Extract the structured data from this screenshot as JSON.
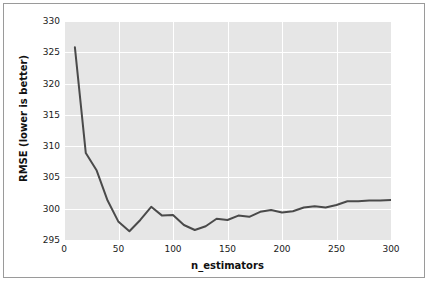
{
  "figure": {
    "background_color": "#ffffff",
    "border_color": "#9a9a9a",
    "plot_background_color": "#e6e6e6",
    "grid_color": "#ffffff",
    "line_color": "#4a4a4a"
  },
  "axes": {
    "xlabel": "n_estimators",
    "ylabel": "RMSE (lower is better)",
    "xticks": [
      "0",
      "50",
      "100",
      "150",
      "200",
      "250",
      "300"
    ],
    "yticks": [
      "295",
      "300",
      "305",
      "310",
      "315",
      "320",
      "325",
      "330"
    ]
  },
  "chart_data": {
    "type": "line",
    "title": "",
    "xlabel": "n_estimators",
    "ylabel": "RMSE (lower is better)",
    "xlim": [
      0,
      300
    ],
    "ylim": [
      295,
      330
    ],
    "xticks": [
      0,
      50,
      100,
      150,
      200,
      250,
      300
    ],
    "yticks": [
      295,
      300,
      305,
      310,
      315,
      320,
      325,
      330
    ],
    "grid": true,
    "legend": "none",
    "series": [
      {
        "name": "RMSE",
        "color": "#4a4a4a",
        "x": [
          10,
          20,
          30,
          40,
          50,
          60,
          70,
          80,
          90,
          100,
          110,
          120,
          130,
          140,
          150,
          160,
          170,
          180,
          190,
          200,
          210,
          220,
          230,
          240,
          250,
          260,
          270,
          280,
          290,
          300
        ],
        "values": [
          325.8,
          308.9,
          306.1,
          301.3,
          297.9,
          296.4,
          298.2,
          300.3,
          298.9,
          299.0,
          297.4,
          296.6,
          297.2,
          298.4,
          298.2,
          298.9,
          298.7,
          299.5,
          299.8,
          299.4,
          299.6,
          300.2,
          300.4,
          300.2,
          300.6,
          301.2,
          301.2,
          301.3,
          301.3,
          301.4
        ]
      }
    ]
  }
}
